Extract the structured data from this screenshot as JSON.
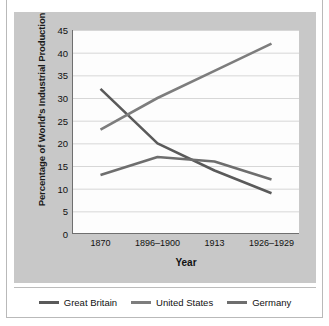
{
  "figure": {
    "cut_off_title": "",
    "panel_color": "#c8c8c8",
    "plot_bg": "#fdfdfd"
  },
  "axes": {
    "ylabel": "Percentage of World's Industrial Production",
    "xlabel": "Year",
    "yticks": [
      "45",
      "40",
      "35",
      "30",
      "25",
      "20",
      "15",
      "10",
      "5",
      "0"
    ],
    "xticks": [
      "1870",
      "1896–1900",
      "1913",
      "1926–1929"
    ]
  },
  "legend": {
    "items": [
      {
        "label": "Great Britain",
        "color": "#5a5a5a"
      },
      {
        "label": "United States",
        "color": "#7d7d7d"
      },
      {
        "label": "Germany",
        "color": "#6e6e6e"
      }
    ]
  },
  "chart_data": {
    "type": "line",
    "title": "",
    "xlabel": "Year",
    "ylabel": "Percentage of World's Industrial Production",
    "categories": [
      "1870",
      "1896–1900",
      "1913",
      "1926–1929"
    ],
    "ylim": [
      0,
      45
    ],
    "ytick_step": 5,
    "grid": "horizontal",
    "legend_position": "bottom",
    "series": [
      {
        "name": "Great Britain",
        "color": "#5a5a5a",
        "values": [
          32,
          20,
          14,
          9
        ]
      },
      {
        "name": "United States",
        "color": "#7d7d7d",
        "values": [
          23,
          30,
          36,
          42
        ]
      },
      {
        "name": "Germany",
        "color": "#6e6e6e",
        "values": [
          13,
          17,
          16,
          12
        ]
      }
    ]
  }
}
